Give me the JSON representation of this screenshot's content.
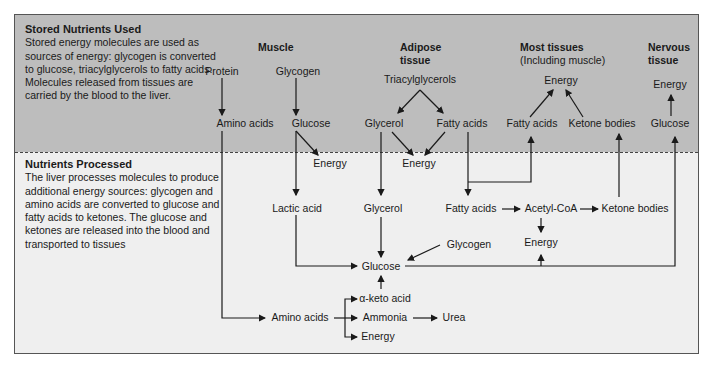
{
  "sections": {
    "stored": {
      "title": "Stored Nutrients Used",
      "text": "Stored energy molecules are used as sources of energy: glycogen is converted to glucose, triacylglycerols to fatty acids. Molecules released from tissues are carried by the blood to the liver."
    },
    "processed": {
      "title": "Nutrients Processed",
      "text": "The liver processes molecules to produce additional energy sources: glycogen and amino acids are converted to glucose and fatty acids to ketones. The glucose and ketones are released into the blood and transported to tissues"
    }
  },
  "columns": {
    "muscle": "Muscle",
    "adipose_1": "Adipose",
    "adipose_2": "tissue",
    "most_1": "Most tissues",
    "most_2": "(Including muscle)",
    "nervous_1": "Nervous",
    "nervous_2": "tissue"
  },
  "nodes": {
    "protein": "Protein",
    "glycogen_muscle": "Glycogen",
    "amino_acids_muscle": "Amino acids",
    "glucose_muscle": "Glucose",
    "energy_muscle": "Energy",
    "triacylglycerols": "Triacylglycerols",
    "glycerol_adipose": "Glycerol",
    "fatty_acids_adipose": "Fatty acids",
    "energy_adipose": "Energy",
    "energy_most": "Energy",
    "fatty_acids_most": "Fatty acids",
    "ketone_bodies_most": "Ketone bodies",
    "energy_nervous": "Energy",
    "glucose_nervous": "Glucose",
    "lactic_acid": "Lactic acid",
    "glycerol_liver": "Glycerol",
    "fatty_acids_liver": "Fatty acids",
    "acetyl_coa": "Acetyl-CoA",
    "ketone_bodies_liver": "Ketone bodies",
    "energy_liver": "Energy",
    "glycogen_liver": "Glycogen",
    "glucose_liver": "Glucose",
    "alpha_keto_acid": "α-keto acid",
    "amino_acids_liver": "Amino acids",
    "ammonia": "Ammonia",
    "urea": "Urea",
    "energy_amino": "Energy"
  },
  "colors": {
    "top_band": "#bdbdbd",
    "bottom_band": "#efefef",
    "line": "#1a1a1a"
  }
}
